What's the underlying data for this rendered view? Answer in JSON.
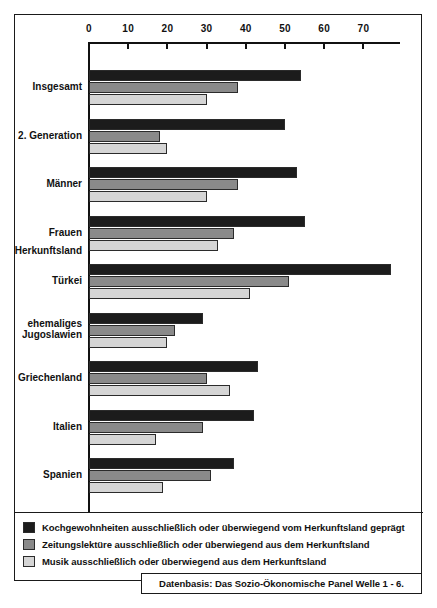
{
  "chart_data": {
    "type": "bar",
    "orientation": "horizontal",
    "title": "",
    "xlabel": "",
    "ylabel": "",
    "xlim": [
      0,
      78
    ],
    "xticks": [
      0,
      10,
      20,
      30,
      40,
      50,
      60,
      70
    ],
    "xtick_labels": [
      "0",
      "10",
      "20",
      "30",
      "40",
      "50",
      "60",
      "70"
    ],
    "grid": false,
    "legend_position": "bottom",
    "categories": [
      "Insgesamt",
      "2. Generation",
      "Männer",
      "Frauen",
      "Türkei",
      "ehemaliges\nJugoslawien",
      "Griechenland",
      "Italien",
      "Spanien"
    ],
    "group_header": "Herkunftsland",
    "series": [
      {
        "name": "Kochgewohnheiten ausschließlich oder überwiegend vom Herkunftsland geprägt",
        "color": "#1c1c1c",
        "values": [
          54,
          50,
          53,
          55,
          77,
          29,
          43,
          42,
          37
        ]
      },
      {
        "name": "Zeitungslektüre ausschließlich oder überwiegend aus dem Herkunftsland",
        "color": "#8a8a8a",
        "values": [
          38,
          18,
          38,
          37,
          51,
          22,
          30,
          29,
          31
        ]
      },
      {
        "name": "Musik ausschließlich oder überwiegend aus dem Herkunftsland",
        "color": "#d5d5d5",
        "values": [
          30,
          20,
          30,
          33,
          41,
          20,
          36,
          17,
          19
        ]
      }
    ],
    "source_note": "Datenbasis: Das Sozio-Ökonomische Panel Welle 1 - 6."
  }
}
